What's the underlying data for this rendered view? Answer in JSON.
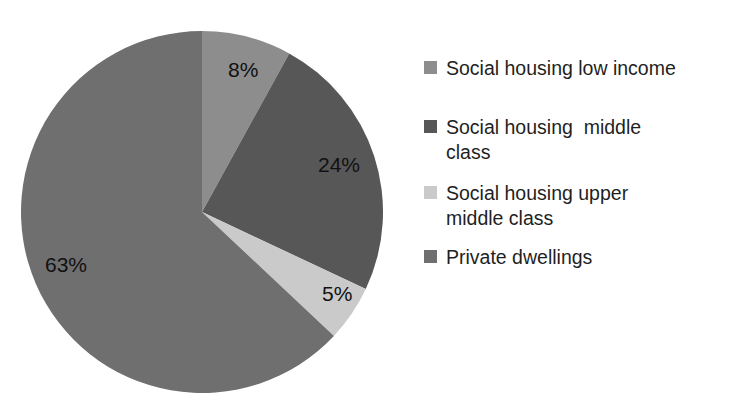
{
  "chart_data": {
    "type": "pie",
    "title": "",
    "categories": [
      "Social housing low income",
      "Social housing  middle class",
      "Social housing upper middle class",
      "Private dwellings"
    ],
    "values": [
      8,
      24,
      5,
      63
    ],
    "value_labels": [
      "8%",
      "24%",
      "5%",
      "63%"
    ],
    "unit": "%",
    "colors": [
      "#8d8d8d",
      "#575757",
      "#cacaca",
      "#6f6f6f"
    ],
    "legend_position": "right",
    "grid": false,
    "start_angle_deg": 0,
    "direction": "clockwise",
    "xlabel": "",
    "ylabel": ""
  },
  "figure": {
    "title": "",
    "background": "#ffffff"
  },
  "pie": {
    "center_x": 202,
    "center_y": 212,
    "radius": 181,
    "labels": [
      {
        "text": "8%",
        "x": 228,
        "y": 77
      },
      {
        "text": "24%",
        "x": 318,
        "y": 172
      },
      {
        "text": "5%",
        "x": 322,
        "y": 301
      },
      {
        "text": "63%",
        "x": 45,
        "y": 272
      }
    ]
  },
  "legend": {
    "items": [
      {
        "label": "Social housing low income",
        "color": "#8d8d8d",
        "swatch_name": "legend-swatch-social-housing-low-income"
      },
      {
        "label": "Social housing  middle\nclass",
        "color": "#575757",
        "swatch_name": "legend-swatch-social-housing-middle-class"
      },
      {
        "label": "Social housing upper\nmiddle class",
        "color": "#cacaca",
        "swatch_name": "legend-swatch-social-housing-upper-middle-class"
      },
      {
        "label": "Private dwellings",
        "color": "#6f6f6f",
        "swatch_name": "legend-swatch-private-dwellings"
      }
    ]
  }
}
